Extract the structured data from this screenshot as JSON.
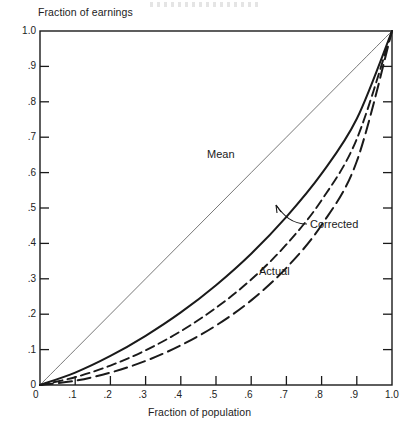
{
  "chart_data": {
    "type": "line",
    "title": "",
    "xlabel": "Fraction of population",
    "ylabel": "Fraction of earnings",
    "xlim": [
      0,
      1.0
    ],
    "ylim": [
      0,
      1.0
    ],
    "grid": false,
    "legend_position": "inline-annotations",
    "xticks": [
      "0",
      ".1",
      ".2",
      ".3",
      ".4",
      ".5",
      ".6",
      ".7",
      ".8",
      ".9",
      "1.0"
    ],
    "yticks": [
      "0",
      ".1",
      ".2",
      ".3",
      ".4",
      ".5",
      ".6",
      ".7",
      ".8",
      ".9",
      "1.0"
    ],
    "x": [
      0,
      0.1,
      0.2,
      0.3,
      0.4,
      0.5,
      0.6,
      0.7,
      0.8,
      0.9,
      1.0
    ],
    "series": [
      {
        "name": "Line of equality",
        "label": "",
        "style": "thin-solid",
        "values": [
          0,
          0.1,
          0.2,
          0.3,
          0.4,
          0.5,
          0.6,
          0.7,
          0.8,
          0.9,
          1.0
        ]
      },
      {
        "name": "Mean",
        "label": "Mean",
        "style": "solid",
        "values": [
          0,
          0.035,
          0.082,
          0.139,
          0.205,
          0.282,
          0.371,
          0.475,
          0.597,
          0.752,
          1.0
        ]
      },
      {
        "name": "Corrected",
        "label": "Corrected",
        "style": "dashed",
        "values": [
          0,
          0.022,
          0.055,
          0.098,
          0.152,
          0.218,
          0.298,
          0.397,
          0.522,
          0.695,
          1.0
        ]
      },
      {
        "name": "Actual",
        "label": "Actual",
        "style": "long-dashed",
        "values": [
          0,
          0.012,
          0.035,
          0.068,
          0.112,
          0.168,
          0.239,
          0.331,
          0.452,
          0.632,
          1.0
        ]
      }
    ],
    "annotations": [
      {
        "text": "Mean",
        "type": "curve-label"
      },
      {
        "text": "Corrected",
        "type": "curve-label-with-leader"
      },
      {
        "text": "Actual",
        "type": "curve-label"
      }
    ]
  },
  "axes": {
    "y_axis_title": "Fraction of earnings",
    "x_axis_title": "Fraction of population",
    "x_tick_labels": [
      "0",
      ".1",
      ".2",
      ".3",
      ".4",
      ".5",
      ".6",
      ".7",
      ".8",
      ".9",
      "1.0"
    ],
    "y_tick_labels": [
      "1.0",
      ".9",
      ".8",
      ".7",
      ".6",
      ".5",
      ".4",
      ".3",
      ".2",
      ".1",
      "0"
    ]
  },
  "labels": {
    "mean": "Mean",
    "corrected": "Corrected",
    "actual": "Actual"
  },
  "colors": {
    "ink": "#1a1a1a",
    "background": "#ffffff",
    "thin_line": "#555555"
  }
}
